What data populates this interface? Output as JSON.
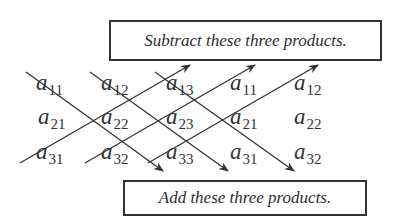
{
  "labels": {
    "top_box": "Subtract these three products.",
    "bottom_box": "Add these three products."
  },
  "matrix": {
    "rows": [
      [
        {
          "base": "a",
          "sub": "11"
        },
        {
          "base": "a",
          "sub": "12"
        },
        {
          "base": "a",
          "sub": "13"
        },
        {
          "base": "a",
          "sub": "11"
        },
        {
          "base": "a",
          "sub": "12"
        }
      ],
      [
        {
          "base": "a",
          "sub": "21"
        },
        {
          "base": "a",
          "sub": "22"
        },
        {
          "base": "a",
          "sub": "23"
        },
        {
          "base": "a",
          "sub": "21"
        },
        {
          "base": "a",
          "sub": "22"
        }
      ],
      [
        {
          "base": "a",
          "sub": "31"
        },
        {
          "base": "a",
          "sub": "32"
        },
        {
          "base": "a",
          "sub": "33"
        },
        {
          "base": "a",
          "sub": "31"
        },
        {
          "base": "a",
          "sub": "32"
        }
      ]
    ]
  },
  "diagonals": {
    "add": [
      "a11-a22-a33",
      "a12-a23-a31",
      "a13-a21-a32"
    ],
    "subtract": [
      "a31-a22-a13",
      "a32-a23-a11",
      "a33-a21-a12"
    ]
  },
  "colors": {
    "line": "#333333",
    "text": "#2e2e2e",
    "background": "#ffffff"
  }
}
